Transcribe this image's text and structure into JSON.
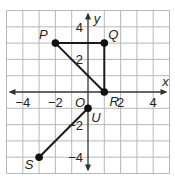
{
  "chart_data": {
    "type": "scatter",
    "title": "",
    "xlabel": "x",
    "ylabel": "y",
    "xlim": [
      -5,
      5
    ],
    "ylim": [
      -5,
      5
    ],
    "grid": true,
    "origin_label": "O",
    "x_ticks": [
      {
        "value": -4,
        "label": "−4"
      },
      {
        "value": -2,
        "label": "−2"
      },
      {
        "value": 2,
        "label": "2"
      },
      {
        "value": 4,
        "label": "4"
      }
    ],
    "y_ticks": [
      {
        "value": 4,
        "label": "4"
      },
      {
        "value": 2,
        "label": "2"
      },
      {
        "value": -2,
        "label": "−2"
      },
      {
        "value": -4,
        "label": "−4"
      }
    ],
    "points": [
      {
        "name": "P",
        "x": -2,
        "y": 3
      },
      {
        "name": "Q",
        "x": 1,
        "y": 3
      },
      {
        "name": "R",
        "x": 1,
        "y": 0
      },
      {
        "name": "U",
        "x": 0,
        "y": -1
      },
      {
        "name": "S",
        "x": -3,
        "y": -4
      }
    ],
    "segments": [
      {
        "from": "P",
        "to": "Q"
      },
      {
        "from": "Q",
        "to": "R"
      },
      {
        "from": "P",
        "to": "R"
      },
      {
        "from": "S",
        "to": "U"
      }
    ]
  },
  "colors": {
    "grid": "#b8b8b8",
    "axis": "#333333",
    "segment": "#1a1a1a",
    "point": "#111111"
  }
}
